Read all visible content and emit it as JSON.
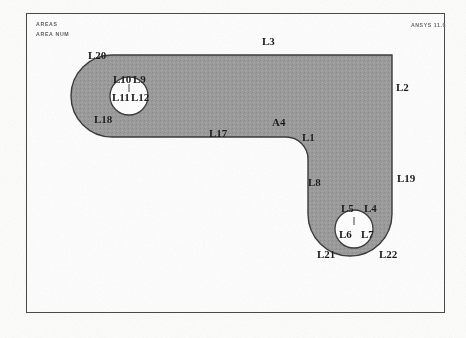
{
  "window": {
    "title": "AREAS",
    "background_color": "#ffffff"
  },
  "header": {
    "line1": "AREAS",
    "line2": "AREA NUM",
    "version": "ANSYS 11.0"
  },
  "plot": {
    "frame_color": "#4a4a4a",
    "fill_color": "#9a9a9a",
    "outline_color": "#3a3a3a",
    "hole_color": "#ffffff"
  },
  "labels": [
    {
      "id": "L20",
      "text": "L20",
      "x": 88,
      "y": 50
    },
    {
      "id": "L3",
      "text": "L3",
      "x": 262,
      "y": 36
    },
    {
      "id": "L2",
      "text": "L2",
      "x": 396,
      "y": 82
    },
    {
      "id": "L10",
      "text": "L10",
      "x": 113,
      "y": 74
    },
    {
      "id": "L9",
      "text": "L9",
      "x": 133,
      "y": 74
    },
    {
      "id": "L11",
      "text": "L11",
      "x": 112,
      "y": 92
    },
    {
      "id": "L12",
      "text": "L12",
      "x": 131,
      "y": 92
    },
    {
      "id": "L18",
      "text": "L18",
      "x": 94,
      "y": 114
    },
    {
      "id": "L17",
      "text": "L17",
      "x": 209,
      "y": 128
    },
    {
      "id": "A4",
      "text": "A4",
      "x": 272,
      "y": 117
    },
    {
      "id": "L1",
      "text": "L1",
      "x": 302,
      "y": 132
    },
    {
      "id": "L19",
      "text": "L19",
      "x": 397,
      "y": 173
    },
    {
      "id": "L8",
      "text": "L8",
      "x": 308,
      "y": 177
    },
    {
      "id": "L5",
      "text": "L5",
      "x": 341,
      "y": 203
    },
    {
      "id": "L4",
      "text": "L4",
      "x": 364,
      "y": 203
    },
    {
      "id": "L6",
      "text": "L6",
      "x": 339,
      "y": 229
    },
    {
      "id": "L7",
      "text": "L7",
      "x": 361,
      "y": 229
    },
    {
      "id": "L21",
      "text": "L21",
      "x": 317,
      "y": 249
    },
    {
      "id": "L22",
      "text": "L22",
      "x": 379,
      "y": 249
    }
  ],
  "chart_data": {
    "type": "diagram",
    "title": "AREAS",
    "subtitle": "AREA NUM",
    "areas": [
      {
        "name": "A4",
        "fill": "#9a9a9a"
      }
    ],
    "holes": [
      {
        "name": "left-hole",
        "cx": 129,
        "cy": 96,
        "r": 19,
        "lines": [
          "L9",
          "L10",
          "L11",
          "L12"
        ]
      },
      {
        "name": "bottom-hole",
        "cx": 354,
        "cy": 229,
        "r": 19,
        "lines": [
          "L4",
          "L5",
          "L6",
          "L7"
        ]
      }
    ],
    "lines": [
      "L1",
      "L2",
      "L3",
      "L4",
      "L5",
      "L6",
      "L7",
      "L8",
      "L9",
      "L10",
      "L11",
      "L12",
      "L17",
      "L18",
      "L19",
      "L20",
      "L21",
      "L22"
    ]
  }
}
